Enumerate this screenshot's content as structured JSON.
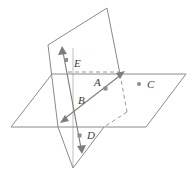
{
  "figure": {
    "type": "geometry-diagram",
    "colors": {
      "background": "#ffffff",
      "plane_edge": "#8a8a8a",
      "hidden_edge": "#9a9a9a",
      "line": "#7d7d7d",
      "point": "#8c8c8c",
      "label_text": "#3d3d3d"
    }
  },
  "labels": {
    "a": "A",
    "b": "B",
    "c": "C",
    "d": "D",
    "e": "E"
  },
  "points": [
    {
      "name": "A",
      "label": "A",
      "x": 106,
      "y": 89,
      "label_x": 94,
      "label_y": 83,
      "on_plane": "horizontal",
      "visible_dot": true
    },
    {
      "name": "B",
      "label": "B",
      "x": 77,
      "y": 105,
      "label_x": 80,
      "label_y": 100,
      "on_plane": "intersection",
      "visible_dot": false
    },
    {
      "name": "C",
      "label": "C",
      "x": 139,
      "y": 84,
      "label_x": 148,
      "label_y": 84,
      "on_plane": "horizontal",
      "visible_dot": true
    },
    {
      "name": "D",
      "label": "D",
      "x": 79,
      "y": 137,
      "label_x": 88,
      "label_y": 136,
      "on_plane": "vertical",
      "visible_dot": true
    },
    {
      "name": "E",
      "label": "E",
      "x": 66,
      "y": 61,
      "label_x": 75,
      "label_y": 63,
      "on_plane": "vertical",
      "visible_dot": true
    }
  ],
  "shapes": {
    "horizontal_plane": {
      "name": "horizontal-plane",
      "points": "11,127 52,74 186,74 146,127"
    },
    "vertical_plane": {
      "name": "vertical-plane",
      "points": "48,45 107,8 127,112 73,168"
    },
    "intersection_line": {
      "name": "intersection-line",
      "x1": 62,
      "y1": 121,
      "x2": 123,
      "y2": 73
    },
    "vertical_line": {
      "name": "vertical-double-arrow-line",
      "x1": 62,
      "y1": 48,
      "x2": 82,
      "y2": 152
    }
  }
}
